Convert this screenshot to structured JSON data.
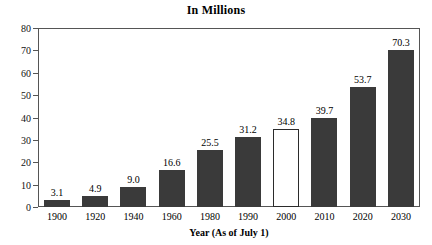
{
  "chart_data": {
    "type": "bar",
    "title": "In Millions",
    "xlabel": "Year (As of July 1)",
    "ylabel": "",
    "categories": [
      "1900",
      "1920",
      "1940",
      "1960",
      "1980",
      "1990",
      "2000",
      "2010",
      "2020",
      "2030"
    ],
    "values": [
      3.1,
      4.9,
      9.0,
      16.6,
      25.5,
      31.2,
      34.8,
      39.7,
      53.7,
      70.3
    ],
    "data_labels": [
      "3.1",
      "4.9",
      "9.0",
      "16.6",
      "25.5",
      "31.2",
      "34.8",
      "39.7",
      "53.7",
      "70.3"
    ],
    "highlighted_category": "2000",
    "ylim": [
      0,
      80
    ],
    "ytick_values": [
      0,
      10,
      20,
      30,
      40,
      50,
      60,
      70,
      80
    ],
    "ytick_labels": [
      "0",
      "10",
      "20",
      "30",
      "40",
      "50",
      "60",
      "70",
      "80"
    ],
    "grid": false,
    "legend": false,
    "bar_color": "#3a3a3a",
    "highlight_bar_color": "#ffffff",
    "highlight_bar_border": "#2b2b2b",
    "axis_color": "#555555",
    "background": "#ffffff"
  }
}
